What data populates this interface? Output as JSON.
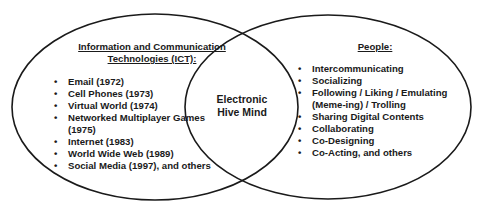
{
  "diagram": {
    "type": "venn",
    "left_set": {
      "heading_line1": "Information and Communication",
      "heading_line2": "Technologies (ICT):",
      "items": [
        "Email (1972)",
        "Cell Phones (1973)",
        "Virtual World (1974)",
        "Networked Multiplayer Games",
        "(1975)",
        "Internet (1983)",
        "World Wide Web (1989)",
        "Social Media (1997), and others"
      ]
    },
    "right_set": {
      "heading": "People:",
      "items": [
        "Intercommunicating",
        "Socializing",
        "Following / Liking / Emulating",
        "(Meme-ing) / Trolling",
        "Sharing Digital Contents",
        "Collaborating",
        "Co-Designing",
        "Co-Acting, and others"
      ]
    },
    "intersection": {
      "line1": "Electronic",
      "line2": "Hive Mind"
    },
    "colors": {
      "stroke": "#1a1a1a",
      "background": "#ffffff",
      "text": "#1a1a1a"
    }
  }
}
